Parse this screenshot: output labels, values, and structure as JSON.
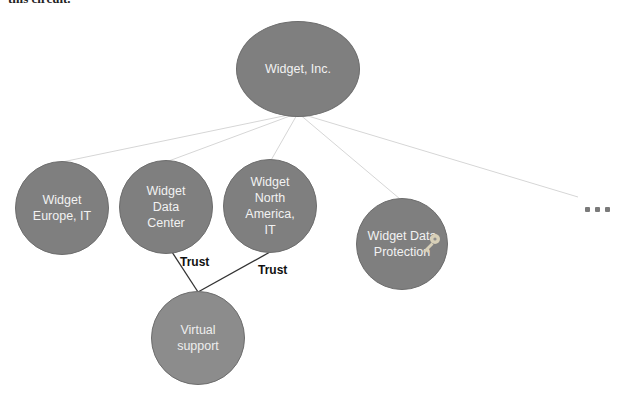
{
  "header_fragment": "this circuit.",
  "diagram": {
    "root": {
      "label": "Widget, Inc."
    },
    "children": [
      {
        "label": "Widget Europe, IT"
      },
      {
        "label": "Widget Data Center"
      },
      {
        "label": "Widget North America, IT"
      },
      {
        "label": "Widget Data Protection",
        "icon": "key-icon"
      }
    ],
    "more_indicator": "...",
    "trust_node": {
      "label": "Virtual support"
    },
    "trust_labels": [
      "Trust",
      "Trust"
    ],
    "colors": {
      "node_fill": "#7f7f7f",
      "node_text": "#f2f2f2",
      "connector": "#d6d6d6",
      "trust_line": "#333333"
    }
  }
}
